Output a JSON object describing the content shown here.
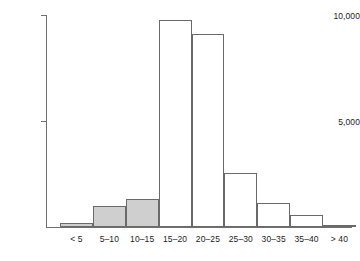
{
  "chart_data": {
    "type": "bar",
    "title": "",
    "subtitle": "",
    "xlabel": "",
    "ylabel": "",
    "grid": false,
    "legend": "none",
    "categories": [
      "< 5",
      "5–10",
      "10–15",
      "15–20",
      "20–25",
      "25–30",
      "30–35",
      "35–40",
      "> 40"
    ],
    "values": [
      170,
      990,
      1320,
      9760,
      9100,
      2550,
      1130,
      570,
      90
    ],
    "ylim": [
      0,
      10000
    ],
    "yticks": [
      5000,
      10000
    ],
    "ytick_labels": [
      "5,000",
      "10,000"
    ],
    "bar_styles": [
      "shaded",
      "shaded",
      "shaded",
      "open",
      "open",
      "open",
      "open",
      "open",
      "open"
    ]
  },
  "style": {
    "shaded_fill": "#cfcfcf",
    "open_fill": "#ffffff",
    "outline": "#6a6a6a",
    "axis": "#6f6f6f",
    "text": "#1c1c1c"
  }
}
